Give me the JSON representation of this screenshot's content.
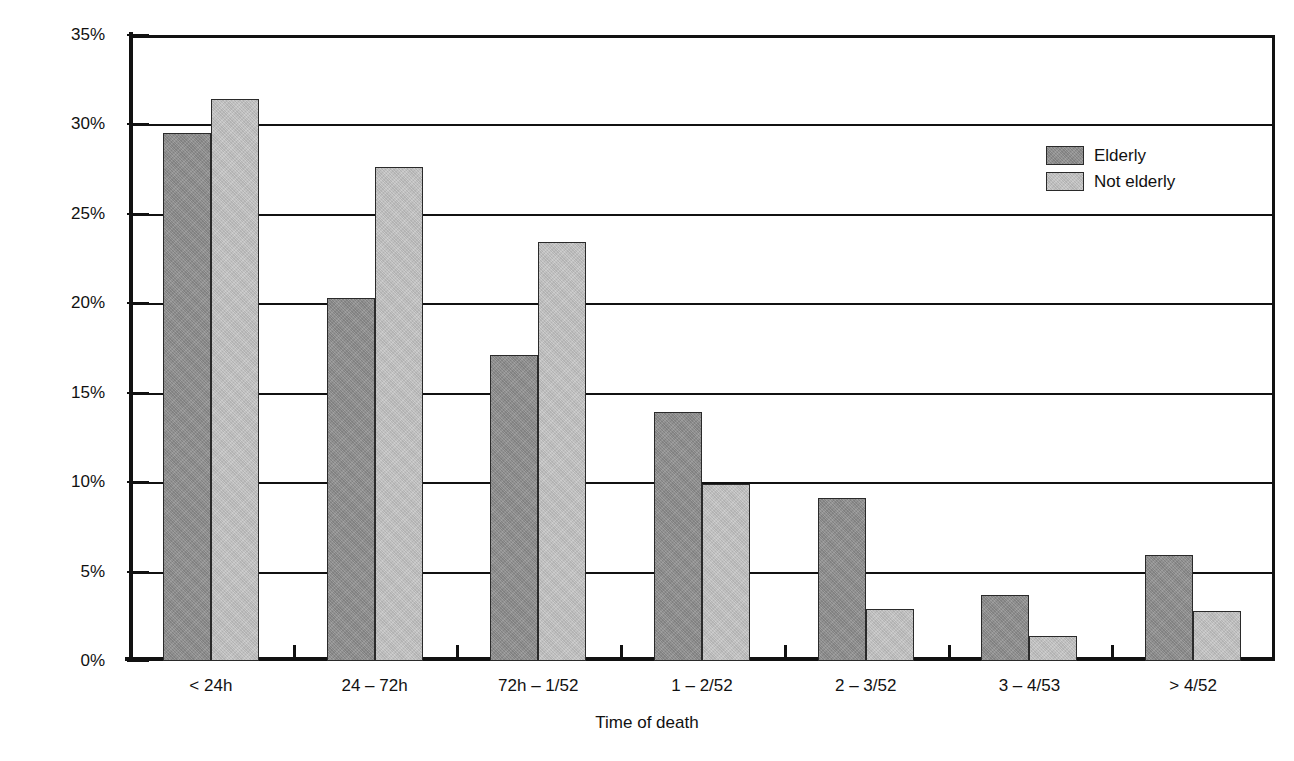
{
  "chart_data": {
    "type": "bar",
    "title": "",
    "xlabel": "Time of death",
    "ylabel": "% of deaths in this time period",
    "categories": [
      "< 24h",
      "24 – 72h",
      "72h – 1/52",
      "1 – 2/52",
      "2 – 3/52",
      "3 – 4/53",
      "> 4/52"
    ],
    "series": [
      {
        "name": "Elderly",
        "color": "#8d8d8d",
        "values": [
          29.5,
          20.3,
          17.1,
          13.9,
          9.1,
          3.7,
          5.9
        ]
      },
      {
        "name": "Not elderly",
        "color": "#bfbfbf",
        "values": [
          31.4,
          27.6,
          23.4,
          9.9,
          2.9,
          1.4,
          2.8
        ]
      }
    ],
    "ylim": [
      0,
      35
    ],
    "yticks": [
      0,
      5,
      10,
      15,
      20,
      25,
      30,
      35
    ],
    "ytick_labels": [
      "0%",
      "5%",
      "10%",
      "15%",
      "20%",
      "25%",
      "30%",
      "35%"
    ],
    "grid": true,
    "grid_axis": "y",
    "legend_position": "top-right",
    "legend": [
      "Elderly",
      "Not elderly"
    ]
  },
  "axes": {
    "y_title": "% of deaths in this time period",
    "x_title": "Time of death"
  },
  "legend": {
    "entries": [
      {
        "label": "Elderly"
      },
      {
        "label": "Not elderly"
      }
    ]
  },
  "colors": {
    "elderly": "#8d8d8d",
    "not_elderly": "#bfbfbf",
    "axis": "#111111",
    "background": "#ffffff"
  }
}
